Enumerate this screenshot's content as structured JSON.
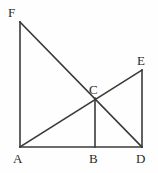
{
  "figure": {
    "kind": "geometry-diagram",
    "width": 158,
    "height": 173,
    "background_color": "#fefefe",
    "stroke_color": "#3a3a3a",
    "label_color": "#2b2b2b",
    "stroke_width": 1.6
  },
  "points": {
    "A": {
      "label": "A",
      "x": 20,
      "y": 147,
      "label_x": 13,
      "label_y": 152
    },
    "B": {
      "label": "B",
      "x": 95,
      "y": 147,
      "label_x": 89,
      "label_y": 152
    },
    "C": {
      "label": "C",
      "x": 95,
      "y": 98,
      "label_x": 89,
      "label_y": 83
    },
    "D": {
      "label": "D",
      "x": 142,
      "y": 147,
      "label_x": 136,
      "label_y": 152
    },
    "E": {
      "label": "E",
      "x": 142,
      "y": 70,
      "label_x": 137,
      "label_y": 54
    },
    "F": {
      "label": "F",
      "x": 20,
      "y": 22,
      "label_x": 8,
      "label_y": 6
    }
  },
  "segments": [
    {
      "name": "segment-AF",
      "from": "A",
      "to": "F"
    },
    {
      "name": "segment-AD",
      "from": "A",
      "to": "D"
    },
    {
      "name": "segment-DE",
      "from": "D",
      "to": "E"
    },
    {
      "name": "segment-FD",
      "from": "F",
      "to": "D"
    },
    {
      "name": "segment-AE",
      "from": "A",
      "to": "E"
    },
    {
      "name": "segment-BC",
      "from": "B",
      "to": "C"
    }
  ],
  "labels_order": [
    "F",
    "E",
    "C",
    "A",
    "B",
    "D"
  ]
}
